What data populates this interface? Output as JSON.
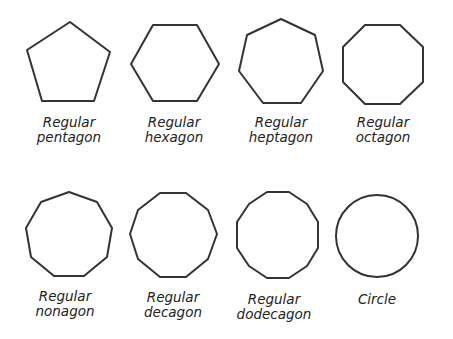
{
  "shapes": [
    {
      "name": "pentagon",
      "line1": "Regular",
      "line2": "pentagon",
      "sides": 5
    },
    {
      "name": "hexagon",
      "line1": "Regular",
      "line2": "hexagon",
      "sides": 6
    },
    {
      "name": "heptagon",
      "line1": "Regular",
      "line2": "heptagon",
      "sides": 7
    },
    {
      "name": "octagon",
      "line1": "Regular",
      "line2": "octagon",
      "sides": 8
    },
    {
      "name": "nonagon",
      "line1": "Regular",
      "line2": "nonagon",
      "sides": 9
    },
    {
      "name": "decagon",
      "line1": "Regular",
      "line2": "decagon",
      "sides": 10
    },
    {
      "name": "dodecagon",
      "line1": "Regular",
      "line2": "dodecagon",
      "sides": 12
    },
    {
      "name": "circle",
      "line1": "Circle",
      "line2": "",
      "sides": 0
    }
  ],
  "stroke_color": "#333333"
}
